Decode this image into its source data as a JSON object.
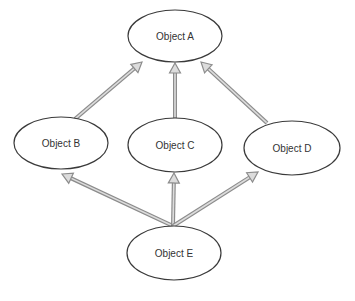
{
  "diagram": {
    "type": "inheritance-graph",
    "colors": {
      "background": "#ffffff",
      "node_stroke": "#3a3a3a",
      "node_fill": "#ffffff",
      "arrow_outline": "#8c8c8c",
      "arrow_fill": "#dcdcdc",
      "label": "#333333"
    },
    "nodes": [
      {
        "id": "A",
        "label": "Object A",
        "cx": 175,
        "cy": 36,
        "rx": 47,
        "ry": 26
      },
      {
        "id": "B",
        "label": "Object B",
        "cx": 61,
        "cy": 143,
        "rx": 47,
        "ry": 26
      },
      {
        "id": "C",
        "label": "Object C",
        "cx": 175,
        "cy": 145,
        "rx": 47,
        "ry": 27
      },
      {
        "id": "D",
        "label": "Object D",
        "cx": 292,
        "cy": 148,
        "rx": 48,
        "ry": 27
      },
      {
        "id": "E",
        "label": "Object E",
        "cx": 174,
        "cy": 253,
        "rx": 47,
        "ry": 27
      }
    ],
    "edges": [
      {
        "from": "B",
        "to": "A",
        "x1": 75,
        "y1": 119,
        "x2": 142,
        "y2": 62
      },
      {
        "from": "C",
        "to": "A",
        "x1": 175,
        "y1": 118,
        "x2": 175,
        "y2": 63
      },
      {
        "from": "D",
        "to": "A",
        "x1": 267,
        "y1": 123,
        "x2": 201,
        "y2": 62
      },
      {
        "from": "E",
        "to": "B",
        "x1": 173,
        "y1": 226,
        "x2": 62,
        "y2": 174
      },
      {
        "from": "E",
        "to": "C",
        "x1": 173,
        "y1": 226,
        "x2": 174,
        "y2": 173
      },
      {
        "from": "E",
        "to": "D",
        "x1": 173,
        "y1": 226,
        "x2": 258,
        "y2": 172
      }
    ]
  }
}
